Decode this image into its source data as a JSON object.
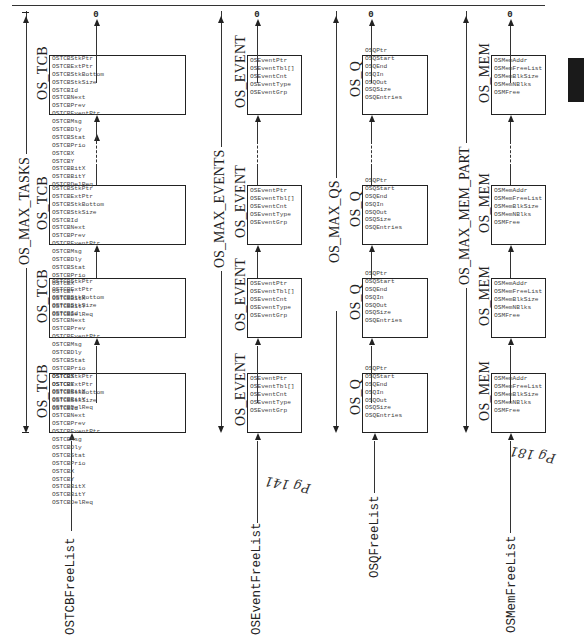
{
  "page": {
    "tab_marker_color": "#1a1a1a",
    "rotation": "diagram rotated 90 degrees counterclockwise"
  },
  "null_terminator": "0",
  "lists": [
    {
      "id": "tcb",
      "free_list_label": "OSTCBFreeList",
      "max_label": "OS_MAX_TASKS",
      "box_title": "OS_TCB",
      "fields": [
        "OSTCBStkPtr",
        "OSTCBExtPtr",
        "OSTCBStkBottom",
        "OSTCBStkSize",
        "OSTCBId",
        "OSTCBNext",
        "OSTCBPrev",
        "OSTCBEventPtr",
        "OSTCBMsg",
        "OSTCBDly",
        "OSTCBStat",
        "OSTCBPrio",
        "OSTCBX",
        "OSTCBY",
        "OSTCBBitX",
        "OSTCBBitY",
        "OSTCBDelReq"
      ],
      "link_field": "OSTCBNext",
      "box_count": 4,
      "handwritten_note": ""
    },
    {
      "id": "event",
      "free_list_label": "OSEventFreeList",
      "max_label": "OS_MAX_EVENTS",
      "box_title": "OS_EVENT",
      "fields": [
        "OSEventPtr",
        "OSEventTbl[]",
        "OSEventCnt",
        "OSEventType",
        "OSEventGrp"
      ],
      "link_field": "OSEventPtr",
      "box_count": 4,
      "handwritten_note": "Pg 141"
    },
    {
      "id": "q",
      "free_list_label": "OSQFreeList",
      "max_label": "OS_MAX_QS",
      "box_title": "OS_Q",
      "fields": [
        "OSQPtr",
        "OSQStart",
        "OSQEnd",
        "OSQIn",
        "OSQOut",
        "OSQSize",
        "OSQEntries"
      ],
      "link_field": "OSQPtr",
      "box_count": 4,
      "handwritten_note": ""
    },
    {
      "id": "mem",
      "free_list_label": "OSMemFreeList",
      "max_label": "OS_MAX_MEM_PART",
      "box_title": "OS_MEM",
      "fields": [
        "OSMemAddr",
        "OSMemFreeList",
        "OSMemBlkSize",
        "OSMemNBlks",
        "OSMFree"
      ],
      "link_field": "OSMemFreeList",
      "box_count": 4,
      "handwritten_note": "Pg 181"
    }
  ]
}
